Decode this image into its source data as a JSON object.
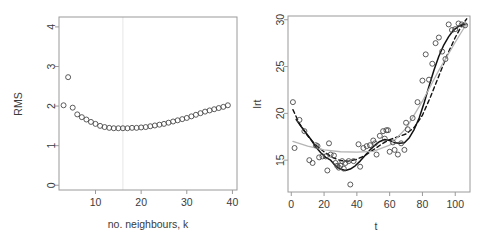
{
  "figure": {
    "kind": "two-panel-scatter",
    "background": "#ffffff",
    "point_color": "#4a4a4a",
    "solid_curve_color": "#111111",
    "dashed_curve_color": "#111111",
    "gray_curve_color": "#b5b5b5",
    "axis_color": "#9a9a9a",
    "gridline_color": "#e6e6e6"
  },
  "chart_data": [
    {
      "type": "scatter",
      "panel": "left",
      "title": "",
      "xlabel": "no. neighbours, k",
      "ylabel": "RMS",
      "xlim": [
        2,
        41
      ],
      "ylim": [
        -0.12,
        4.25
      ],
      "xticks": [
        10,
        20,
        30,
        40
      ],
      "xtick_labels": [
        "10",
        "20",
        "30",
        "40"
      ],
      "yticks": [
        0,
        1,
        2,
        3,
        4
      ],
      "ytick_labels": [
        "0",
        "1",
        "2",
        "3",
        "4"
      ],
      "grid": false,
      "vline_x": 16,
      "marker": "open-circle",
      "x": [
        3,
        4,
        5,
        6,
        7,
        8,
        9,
        10,
        11,
        12,
        13,
        14,
        15,
        16,
        17,
        18,
        19,
        20,
        21,
        22,
        23,
        24,
        25,
        26,
        27,
        28,
        29,
        30,
        31,
        32,
        33,
        34,
        35,
        36,
        37,
        38,
        39
      ],
      "y": [
        2.02,
        2.73,
        1.96,
        1.79,
        1.72,
        1.66,
        1.6,
        1.55,
        1.5,
        1.47,
        1.45,
        1.44,
        1.44,
        1.44,
        1.44,
        1.45,
        1.45,
        1.46,
        1.47,
        1.49,
        1.51,
        1.53,
        1.55,
        1.58,
        1.61,
        1.64,
        1.67,
        1.7,
        1.74,
        1.78,
        1.82,
        1.86,
        1.89,
        1.92,
        1.95,
        1.98,
        2.02
      ]
    },
    {
      "type": "scatter",
      "panel": "right",
      "title": "",
      "xlabel": "t",
      "ylabel": "lrt",
      "xlim": [
        -2,
        109
      ],
      "ylim": [
        11.6,
        30.4
      ],
      "xticks": [
        0,
        20,
        40,
        60,
        80,
        100
      ],
      "xtick_labels": [
        "0",
        "20",
        "40",
        "60",
        "80",
        "100"
      ],
      "yticks": [
        15,
        20,
        25,
        30
      ],
      "ytick_labels": [
        "15",
        "20",
        "25",
        "30"
      ],
      "grid": false,
      "marker": "open-circle",
      "x": [
        1,
        2,
        5,
        8,
        11,
        13,
        15,
        16,
        17,
        19,
        21,
        22,
        23,
        24,
        26,
        27,
        28,
        29,
        30,
        31,
        32,
        33,
        35,
        36,
        38,
        41,
        42,
        44,
        46,
        48,
        50,
        51,
        52,
        54,
        56,
        57,
        58,
        59,
        60,
        62,
        63,
        65,
        67,
        69,
        70,
        71,
        74,
        77,
        80,
        82,
        84,
        86,
        88,
        90,
        92,
        94,
        96,
        98,
        100,
        102,
        104,
        106
      ],
      "y": [
        21.2,
        16.3,
        19.3,
        18.1,
        15.0,
        14.7,
        16.6,
        16.5,
        15.3,
        15.4,
        15.4,
        13.9,
        16.8,
        15.6,
        15.5,
        14.7,
        14.4,
        14.2,
        14.4,
        14.9,
        14.1,
        14.7,
        14.9,
        12.4,
        14.9,
        16.7,
        14.3,
        16.3,
        16.5,
        16.6,
        17.1,
        16.8,
        15.6,
        17.6,
        18.1,
        17.3,
        18.2,
        18.2,
        15.9,
        16.9,
        16.1,
        15.6,
        16.8,
        16.1,
        19.0,
        18.3,
        19.5,
        21.2,
        23.5,
        26.3,
        23.6,
        25.3,
        27.5,
        28.1,
        26.6,
        25.8,
        29.5,
        28.9,
        29.0,
        29.6,
        29.5,
        29.4
      ],
      "series": [
        {
          "name": "solid-smoother",
          "style": "solid",
          "color": "#111111",
          "x": [
            3,
            6,
            9,
            12,
            15,
            18,
            21,
            24,
            27,
            30,
            33,
            36,
            39,
            42,
            45,
            48,
            51,
            54,
            57,
            60,
            63,
            66,
            69,
            72,
            75,
            78,
            81,
            84,
            87,
            90,
            93,
            96,
            99,
            102,
            105,
            107
          ],
          "y": [
            19.35,
            18.6,
            17.9,
            17.2,
            16.4,
            15.8,
            15.3,
            15.0,
            14.4,
            14.05,
            13.9,
            14.05,
            14.4,
            14.9,
            15.5,
            16.1,
            16.6,
            17.0,
            17.2,
            17.1,
            16.85,
            16.8,
            16.85,
            17.4,
            18.3,
            19.5,
            21.1,
            22.9,
            24.6,
            26.1,
            27.3,
            28.2,
            28.9,
            29.3,
            29.5,
            29.5
          ]
        },
        {
          "name": "dashed-smoother",
          "style": "dashed",
          "color": "#111111",
          "x": [
            1,
            5,
            10,
            15,
            20,
            25,
            30,
            35,
            40,
            45,
            50,
            55,
            60,
            65,
            70,
            75,
            80,
            85,
            90,
            95,
            100,
            104,
            107
          ],
          "y": [
            20.4,
            18.9,
            17.6,
            16.6,
            15.9,
            15.3,
            14.95,
            14.9,
            15.1,
            15.5,
            16.1,
            16.7,
            17.2,
            17.5,
            17.8,
            18.5,
            19.8,
            21.8,
            24.0,
            26.2,
            28.1,
            29.4,
            30.1
          ]
        },
        {
          "name": "gray-smoother",
          "style": "solid",
          "color": "#b5b5b5",
          "x": [
            1,
            10,
            20,
            30,
            40,
            50,
            60,
            70,
            80,
            90,
            100,
            107
          ],
          "y": [
            17.0,
            16.5,
            16.1,
            15.9,
            15.85,
            15.95,
            16.6,
            18.4,
            21.3,
            24.6,
            27.6,
            29.6
          ]
        }
      ]
    }
  ]
}
